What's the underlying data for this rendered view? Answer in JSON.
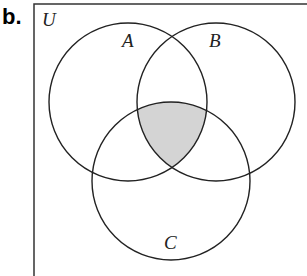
{
  "part_label": "b.",
  "universe_label": "U",
  "sets": [
    {
      "name": "A",
      "cx": 128,
      "cy": 102,
      "r": 79,
      "label_x": 118,
      "label_y": 46
    },
    {
      "name": "B",
      "cx": 216,
      "cy": 102,
      "r": 79,
      "label_x": 207,
      "label_y": 46
    },
    {
      "name": "C",
      "cx": 171,
      "cy": 181,
      "r": 79,
      "label_x": 164,
      "label_y": 248
    }
  ],
  "shaded_region": "A ∩ B ∩ C",
  "colors": {
    "stroke": "#222222",
    "shade": "#d4d4d4",
    "box": "#333333"
  }
}
